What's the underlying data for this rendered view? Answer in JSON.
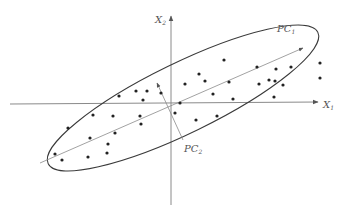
{
  "diagram": {
    "colors": {
      "axis": "#7a7a7a",
      "ellipse": "#3a3a3a",
      "pc_line": "#8a8a8a",
      "point": "#222222",
      "label": "#555555"
    },
    "labels": {
      "x1": {
        "main": "X",
        "sub": "1"
      },
      "x2": {
        "main": "X",
        "sub": "2"
      },
      "pc1": {
        "main": "PC",
        "sub": "1"
      },
      "pc2": {
        "main": "PC",
        "sub": "2"
      }
    },
    "origin": [
      172,
      103
    ],
    "points": [
      [
        224,
        60
      ],
      [
        257,
        67
      ],
      [
        291,
        67
      ],
      [
        320,
        63
      ],
      [
        199,
        74
      ],
      [
        269,
        80
      ],
      [
        275,
        81
      ],
      [
        276,
        69
      ],
      [
        320,
        78
      ],
      [
        185,
        84
      ],
      [
        205,
        81
      ],
      [
        229,
        82
      ],
      [
        259,
        84
      ],
      [
        283,
        85
      ],
      [
        274,
        97
      ],
      [
        147,
        91
      ],
      [
        136,
        91
      ],
      [
        161,
        93
      ],
      [
        119,
        96
      ],
      [
        143,
        100
      ],
      [
        213,
        94
      ],
      [
        233,
        99
      ],
      [
        217,
        116
      ],
      [
        196,
        120
      ],
      [
        175,
        113
      ],
      [
        180,
        103
      ],
      [
        93,
        115
      ],
      [
        113,
        116
      ],
      [
        140,
        116
      ],
      [
        141,
        124
      ],
      [
        115,
        133
      ],
      [
        90,
        138
      ],
      [
        68,
        128
      ],
      [
        55,
        154
      ],
      [
        62,
        160
      ],
      [
        88,
        157
      ],
      [
        107,
        153
      ],
      [
        108,
        144
      ]
    ]
  }
}
